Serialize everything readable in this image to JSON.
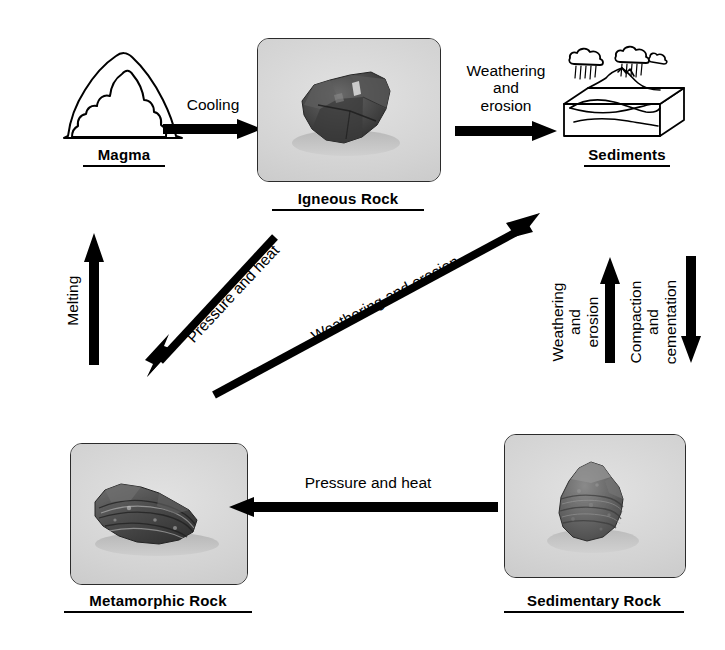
{
  "diagram": {
    "nodes": {
      "magma": {
        "label": "Magma",
        "icon": "volcano-magma-icon"
      },
      "igneous": {
        "label": "Igneous Rock",
        "icon": "igneous-rock-photo"
      },
      "sediments": {
        "label": "Sediments",
        "icon": "sediment-block-diagram-icon"
      },
      "metamorphic": {
        "label": "Metamorphic Rock",
        "icon": "metamorphic-rock-photo"
      },
      "sedimentary": {
        "label": "Sedimentary Rock",
        "icon": "sedimentary-rock-photo"
      }
    },
    "arrows": {
      "cooling": {
        "label": "Cooling",
        "from": "magma",
        "to": "igneous",
        "direction": "right"
      },
      "weathering_top": {
        "label_lines": [
          "Weathering",
          "and",
          "erosion"
        ],
        "from": "igneous",
        "to": "sediments",
        "direction": "right"
      },
      "melting": {
        "label": "Melting",
        "from": "metamorphic",
        "to": "magma",
        "direction": "up"
      },
      "pressure_heat_diagonal": {
        "label": "Pressure and heat",
        "from": "igneous",
        "to": "metamorphic",
        "direction": "down-left"
      },
      "weathering_diagonal": {
        "label": "Weathering and erosion",
        "from": "metamorphic",
        "to": "sediments",
        "direction": "up-right"
      },
      "weathering_vertical": {
        "label_lines": [
          "Weathering",
          "and",
          "erosion"
        ],
        "from": "sedimentary",
        "to": "sediments",
        "direction": "up"
      },
      "compaction": {
        "label_lines": [
          "Compaction",
          "and",
          "cementation"
        ],
        "from": "sediments",
        "to": "sedimentary",
        "direction": "down"
      },
      "pressure_heat_bottom": {
        "label": "Pressure and heat",
        "from": "sedimentary",
        "to": "metamorphic",
        "direction": "left"
      }
    },
    "colors": {
      "ink": "#000000",
      "photo_background": "#d6d6d6",
      "rock_dark": "#3d3d3d",
      "rock_mid": "#6e6e6e",
      "page": "#ffffff"
    }
  }
}
